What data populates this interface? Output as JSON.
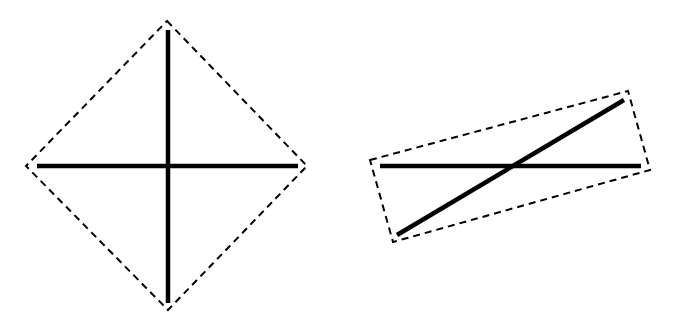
{
  "diagram": {
    "background": "#ffffff",
    "stroke_color": "#000000",
    "figures": [
      {
        "name": "diamond-bounding-box",
        "bounding_box": {
          "style": "dashed",
          "points": [
            [
              167,
              21
            ],
            [
              307,
              166
            ],
            [
              168,
              310
            ],
            [
              26,
              166
            ]
          ]
        },
        "lines": [
          {
            "name": "vertical-line",
            "x1": 168,
            "y1": 30,
            "x2": 168,
            "y2": 303
          },
          {
            "name": "horizontal-line",
            "x1": 37,
            "y1": 166,
            "x2": 298,
            "y2": 166
          }
        ]
      },
      {
        "name": "tilted-bounding-box",
        "bounding_box": {
          "style": "dashed",
          "points": [
            [
              370,
              160
            ],
            [
              628,
              91
            ],
            [
              650,
              170
            ],
            [
              393,
              242
            ]
          ]
        },
        "lines": [
          {
            "name": "horizontal-line",
            "x1": 380,
            "y1": 166,
            "x2": 641,
            "y2": 166
          },
          {
            "name": "diagonal-line",
            "x1": 397,
            "y1": 235,
            "x2": 624,
            "y2": 100
          }
        ]
      }
    ]
  }
}
